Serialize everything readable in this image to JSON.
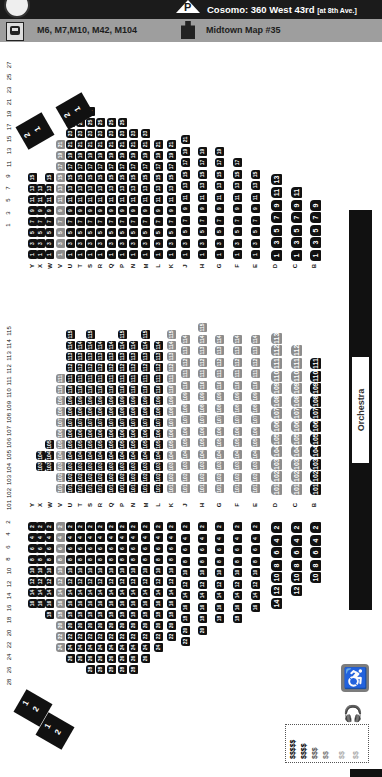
{
  "header": {
    "parking_icon": "P",
    "parking_text": "Cosomo: 360 West 43rd",
    "parking_note": "[at 8th Ave.]",
    "bus_icon": "bus-icon",
    "bus_routes": "M6, M7,M10, M42, M104",
    "map_icon": "map-icon",
    "map_ref": "Midtown Map #35"
  },
  "stage": {
    "label": "Orchestra"
  },
  "colors": {
    "seat_dark": "#111111",
    "seat_gray": "#8d8d8d",
    "topbar": "#1b1b1b",
    "infobar": "#9e9e9e"
  },
  "seat_number_headers": {
    "odd": [
      "1",
      "3",
      "5",
      "7",
      "9",
      "11",
      "13",
      "15",
      "17",
      "19",
      "21",
      "23",
      "25",
      "27"
    ],
    "center": [
      "101",
      "102",
      "103",
      "104",
      "105",
      "106",
      "107",
      "108",
      "109",
      "110",
      "111",
      "112",
      "113",
      "114",
      "115"
    ],
    "even": [
      "2",
      "4",
      "6",
      "8",
      "10",
      "12",
      "14",
      "16",
      "18",
      "20",
      "22",
      "24",
      "26",
      "28"
    ]
  },
  "rows": [
    {
      "row": "B",
      "x": 310,
      "odd": 9,
      "center": [
        101,
        111
      ],
      "even": 10,
      "tier": "front"
    },
    {
      "row": "C",
      "x": 291,
      "odd": 11,
      "center": [
        101,
        112
      ],
      "even": 12
    },
    {
      "row": "D",
      "x": 271,
      "odd": 13,
      "center": [
        101,
        113
      ],
      "even": 14
    },
    {
      "row": "E",
      "x": 251,
      "odd": 15,
      "center": [
        101,
        114
      ],
      "even": 16
    },
    {
      "row": "F",
      "x": 233,
      "odd": 17,
      "center": [
        101,
        114
      ],
      "even": 18
    },
    {
      "row": "G",
      "x": 215,
      "odd": 19,
      "center": [
        101,
        114
      ],
      "even": 18
    },
    {
      "row": "H",
      "x": 198,
      "odd": 19,
      "center": [
        101,
        115
      ],
      "even": 20
    },
    {
      "row": "J",
      "x": 181,
      "odd": 21,
      "center": [
        101,
        114
      ],
      "even": 22
    },
    {
      "row": "K",
      "x": 167,
      "odd": 21,
      "center": [
        101,
        115
      ],
      "even": 22
    },
    {
      "row": "L",
      "x": 154,
      "odd": 21,
      "center": [
        101,
        114
      ],
      "even": 24
    },
    {
      "row": "M",
      "x": 141,
      "odd": 23,
      "center": [
        101,
        115
      ],
      "even": 26
    },
    {
      "row": "N",
      "x": 129,
      "odd": 23,
      "center": [
        101,
        114
      ],
      "even": 28
    },
    {
      "row": "P",
      "x": 118,
      "odd": 25,
      "center": [
        101,
        115
      ],
      "even": 28
    },
    {
      "row": "Q",
      "x": 107,
      "odd": 25,
      "center": [
        101,
        114
      ],
      "even": 28
    },
    {
      "row": "R",
      "x": 96,
      "odd": 25,
      "center": [
        101,
        114
      ],
      "even": 28
    },
    {
      "row": "S",
      "x": 86,
      "odd": 27,
      "center": [
        101,
        115
      ],
      "even": 28
    },
    {
      "row": "T",
      "x": 76,
      "odd": 27,
      "center": [
        101,
        114
      ],
      "even": 26
    },
    {
      "row": "U",
      "x": 66,
      "odd": 25,
      "center": [
        101,
        115
      ],
      "even": 26
    },
    {
      "row": "V",
      "x": 56,
      "odd": 21,
      "center": [
        101,
        111
      ],
      "even": 24,
      "gray": true
    },
    {
      "row": "W",
      "x": 45,
      "odd": 15,
      "center": [
        103,
        105
      ],
      "even": 18
    },
    {
      "row": "X",
      "x": 36,
      "odd": 13,
      "center": [
        103,
        104
      ],
      "even": 16
    },
    {
      "row": "Y",
      "x": 28,
      "odd": 15,
      "center": [],
      "even": 16
    }
  ],
  "boxes": [
    {
      "name": "box-upper-a",
      "seats": [
        "2",
        "1"
      ]
    },
    {
      "name": "box-upper-b",
      "seats": [
        "2",
        "1"
      ]
    },
    {
      "name": "box-lower-a",
      "seats": [
        "1",
        "2"
      ]
    },
    {
      "name": "box-lower-b",
      "seats": [
        "1",
        "2"
      ]
    }
  ],
  "legend": {
    "accessibility_icon": "wheelchair-icon",
    "hearing_icon": "hearing-device-icon",
    "price_tiers": [
      "$$$$$",
      "$$$$",
      "$$$",
      "$$",
      "$$",
      "$$"
    ]
  }
}
